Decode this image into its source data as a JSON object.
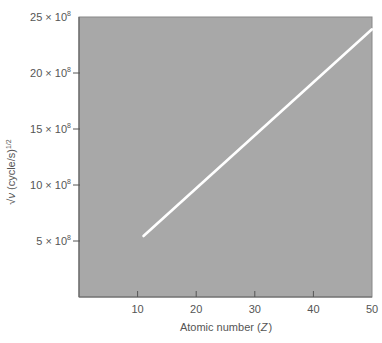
{
  "chart_data": {
    "type": "line",
    "title": "",
    "xlabel": "Atomic number (Z)",
    "xlabel_main": "Atomic number (",
    "xlabel_var": "Z",
    "xlabel_close": ")",
    "ylabel": "√ν (cycle/s)^1/2",
    "ylabel_root": "√",
    "ylabel_var": "ν",
    "ylabel_unit": " (cycle/s)",
    "ylabel_exp": "1/2",
    "xlim": [
      0,
      50
    ],
    "ylim": [
      0,
      2500000000
    ],
    "x_ticks": [
      10,
      20,
      30,
      40,
      50
    ],
    "x_tick_labels": [
      "10",
      "20",
      "30",
      "40",
      "50"
    ],
    "y_ticks": [
      500000000,
      1000000000,
      1500000000,
      2000000000,
      2500000000
    ],
    "y_tick_labels": [
      {
        "mantissa": "5 × 10",
        "exp": "8"
      },
      {
        "mantissa": "10 × 10",
        "exp": "8"
      },
      {
        "mantissa": "15 × 10",
        "exp": "8"
      },
      {
        "mantissa": "20 × 10",
        "exp": "8"
      },
      {
        "mantissa": "25 × 10",
        "exp": "8"
      }
    ],
    "grid": false,
    "legend": null,
    "plot_background": "#a8a8a8",
    "line_color": "#ffffff",
    "series": [
      {
        "name": "Moseley relation",
        "x": [
          11,
          50
        ],
        "y": [
          545000000,
          2390000000
        ]
      }
    ]
  }
}
